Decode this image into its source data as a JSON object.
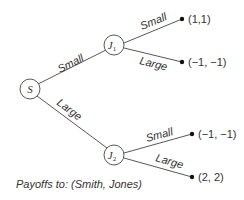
{
  "diagram": {
    "type": "game-tree",
    "nodes": {
      "root": {
        "label": "S"
      },
      "j1": {
        "label": "J",
        "subscript": "1"
      },
      "j2": {
        "label": "J",
        "subscript": "2"
      }
    },
    "edges": {
      "root_j1": "Small",
      "root_j2": "Large",
      "j1_small": "Small",
      "j1_large": "Large",
      "j2_small": "Small",
      "j2_large": "Large"
    },
    "payoffs": {
      "j1_small": "(1,1)",
      "j1_large": "(−1, −1)",
      "j2_small": "(−1, −1)",
      "j2_large": "(2, 2)"
    },
    "caption": "Payoffs to: (Smith, Jones)"
  }
}
